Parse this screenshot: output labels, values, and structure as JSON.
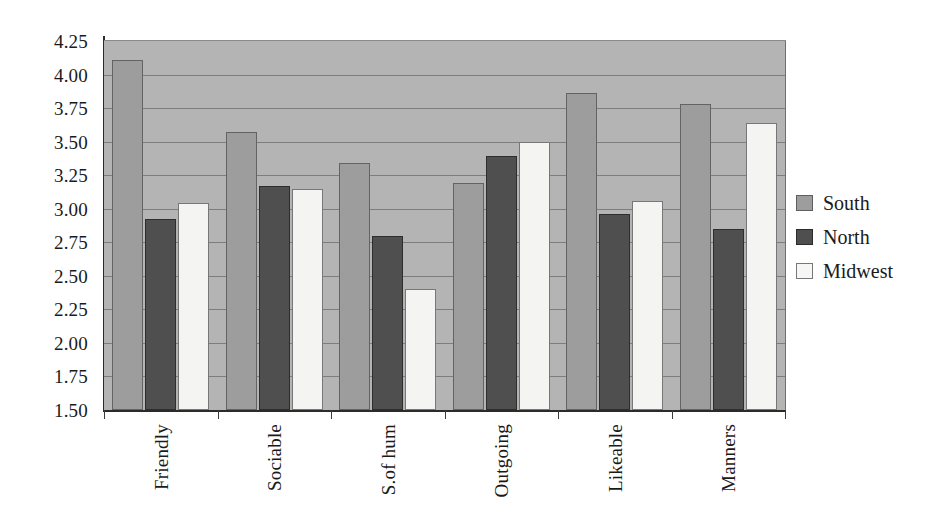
{
  "chart_data": {
    "type": "bar",
    "title": "",
    "subtitle": "",
    "xlabel": "",
    "ylabel": "",
    "categories": [
      "Friendly",
      "Sociable",
      "S.of hum",
      "Outgoing",
      "Likeable",
      "Manners"
    ],
    "series": [
      {
        "name": "South",
        "color": "#9d9d9d",
        "values": [
          4.11,
          3.57,
          3.34,
          3.19,
          3.86,
          3.78
        ]
      },
      {
        "name": "North",
        "color": "#4f4f4f",
        "values": [
          2.92,
          3.17,
          2.8,
          3.39,
          2.96,
          2.85
        ]
      },
      {
        "name": "Midwest",
        "color": "#f4f4f2",
        "values": [
          3.04,
          3.15,
          2.4,
          3.5,
          3.06,
          3.64
        ]
      }
    ],
    "ylim": [
      1.5,
      4.25
    ],
    "yticks": [
      "4.25",
      "4.00",
      "3.75",
      "3.50",
      "3.25",
      "3.00",
      "2.75",
      "2.50",
      "2.25",
      "2.00",
      "1.75",
      "1.50"
    ],
    "ytick_values": [
      4.25,
      4.0,
      3.75,
      3.5,
      3.25,
      3.0,
      2.75,
      2.5,
      2.25,
      2.0,
      1.75,
      1.5
    ],
    "grid": true,
    "grid_axis": "y",
    "legend_position": "right",
    "plot_background": "#b4b4b4",
    "figure_background": "#ffffff"
  },
  "legend": {
    "items": [
      {
        "label": "South",
        "key": "south"
      },
      {
        "label": "North",
        "key": "north"
      },
      {
        "label": "Midwest",
        "key": "midwest"
      }
    ]
  }
}
